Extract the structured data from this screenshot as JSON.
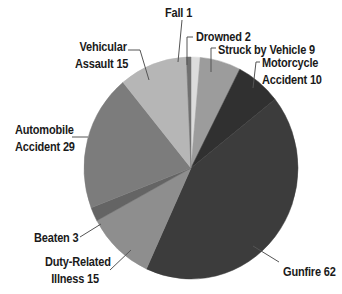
{
  "chart_data": {
    "type": "pie",
    "title": "",
    "start_angle_deg": 0,
    "direction": "clockwise",
    "slices": [
      {
        "label": "Drowned",
        "value": 2,
        "color": "#dcdcdc"
      },
      {
        "label": "Struck by Vehicle",
        "value": 9,
        "color": "#9c9c9c"
      },
      {
        "label": "Motorcycle Accident",
        "value": 10,
        "color": "#303030"
      },
      {
        "label": "Gunfire",
        "value": 62,
        "color": "#3c3c3c"
      },
      {
        "label": "Duty-Related Illness",
        "value": 15,
        "color": "#8e8e8e"
      },
      {
        "label": "Beaten",
        "value": 3,
        "color": "#646464"
      },
      {
        "label": "Automobile Accident",
        "value": 29,
        "color": "#7c7c7c"
      },
      {
        "label": "Vehicular Assault",
        "value": 15,
        "color": "#b6b6b6"
      },
      {
        "label": "Fall",
        "value": 1,
        "color": "#707070"
      }
    ],
    "total": 146
  },
  "labels": {
    "fall": "Fall 1",
    "drowned": "Drowned 2",
    "struck_by_vehicle": "Struck by Vehicle 9",
    "motorcycle_line1": "Motorcycle",
    "motorcycle_line2": "Accident 10",
    "vehicular_line1": "Vehicular",
    "vehicular_line2": "Assault 15",
    "automobile_line1": "Automobile",
    "automobile_line2": "Accident 29",
    "beaten": "Beaten 3",
    "duty_line1": "Duty-Related",
    "duty_line2": "Illness 15",
    "gunfire": "Gunfire 62"
  }
}
